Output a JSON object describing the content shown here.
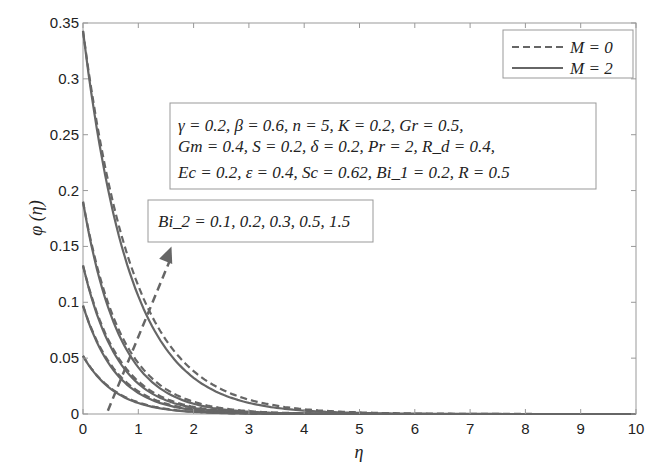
{
  "chart_data": {
    "type": "line",
    "title": "",
    "xlabel": "η",
    "ylabel": "φ (η)",
    "xlim": [
      0,
      10
    ],
    "ylim": [
      0,
      0.35
    ],
    "xticks": [
      0,
      1,
      2,
      3,
      4,
      5,
      6,
      7,
      8,
      9,
      10
    ],
    "yticks": [
      0,
      0.05,
      0.1,
      0.15,
      0.2,
      0.25,
      0.3,
      0.35
    ],
    "ytick_labels": [
      "0",
      "0.05",
      "0.1",
      "0.15",
      "0.2",
      "0.25",
      "0.3",
      "0.35"
    ],
    "grid": false,
    "legend_position": "upper right",
    "legend": [
      {
        "label": "M = 0",
        "style": "dashed"
      },
      {
        "label": "M = 2",
        "style": "solid"
      }
    ],
    "parameter_box": [
      "γ = 0.2, β = 0.6, n = 5, K = 0.2, Gr = 0.5,",
      "Gm = 0.4, S = 0.2, δ = 0.2, Pr = 2, R_d = 0.4,",
      "Ec = 0.2, ε = 0.4, Sc = 0.62, Bi_1 = 0.2, R = 0.5"
    ],
    "annotation": "Bi_2 = 0.1, 0.2, 0.3, 0.5, 1.5",
    "arrow": {
      "from": [
        0.45,
        0.003
      ],
      "to": [
        1.6,
        0.15
      ],
      "style": "dashed",
      "meaning": "increasing Bi_2"
    },
    "series": [
      {
        "name": "Bi2 = 0.1, M = 0",
        "style": "dashed",
        "phi0": 0.052,
        "decay": 0.62
      },
      {
        "name": "Bi2 = 0.1, M = 2",
        "style": "solid",
        "phi0": 0.052,
        "decay": 0.6
      },
      {
        "name": "Bi2 = 0.2, M = 0",
        "style": "dashed",
        "phi0": 0.097,
        "decay": 0.64
      },
      {
        "name": "Bi2 = 0.2, M = 2",
        "style": "solid",
        "phi0": 0.097,
        "decay": 0.61
      },
      {
        "name": "Bi2 = 0.3, M = 0",
        "style": "dashed",
        "phi0": 0.133,
        "decay": 0.66
      },
      {
        "name": "Bi2 = 0.3, M = 2",
        "style": "solid",
        "phi0": 0.133,
        "decay": 0.63
      },
      {
        "name": "Bi2 = 0.5, M = 0",
        "style": "dashed",
        "phi0": 0.19,
        "decay": 0.7
      },
      {
        "name": "Bi2 = 0.5, M = 2",
        "style": "solid",
        "phi0": 0.19,
        "decay": 0.66
      },
      {
        "name": "Bi2 = 1.5, M = 0",
        "style": "dashed",
        "phi0": 0.343,
        "decay": 0.84
      },
      {
        "name": "Bi2 = 1.5, M = 2",
        "style": "solid",
        "phi0": 0.343,
        "decay": 0.78
      }
    ],
    "colors": {
      "curve": "#666666",
      "axis": "#999999",
      "text": "#222222",
      "box": "#999999"
    }
  }
}
